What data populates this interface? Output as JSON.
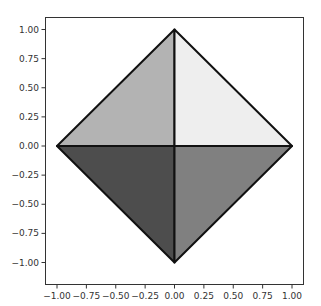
{
  "chart_data": {
    "type": "area",
    "title": "",
    "xlabel": "",
    "ylabel": "",
    "xlim": [
      -1.1,
      1.1
    ],
    "ylim": [
      -1.1,
      1.1
    ],
    "grid": false,
    "legend": null,
    "x_ticks": [
      "-1.00",
      "-0.75",
      "-0.50",
      "-0.25",
      "0.00",
      "0.25",
      "0.50",
      "0.75",
      "1.00"
    ],
    "y_ticks": [
      "1.00",
      "0.75",
      "0.50",
      "0.25",
      "0.00",
      "-0.25",
      "-0.50",
      "-0.75",
      "-1.00"
    ],
    "polygons": [
      {
        "name": "upper-left triangle",
        "vertices": [
          [
            -1,
            0
          ],
          [
            0,
            1
          ],
          [
            0,
            0
          ]
        ],
        "fill": "#b3b3b3"
      },
      {
        "name": "upper-right triangle",
        "vertices": [
          [
            0,
            0
          ],
          [
            0,
            1
          ],
          [
            1,
            0
          ]
        ],
        "fill": "#eeeeee"
      },
      {
        "name": "lower-left triangle",
        "vertices": [
          [
            -1,
            0
          ],
          [
            0,
            0
          ],
          [
            0,
            -1
          ]
        ],
        "fill": "#4d4d4d"
      },
      {
        "name": "lower-right triangle",
        "vertices": [
          [
            0,
            0
          ],
          [
            1,
            0
          ],
          [
            0,
            -1
          ]
        ],
        "fill": "#808080"
      }
    ],
    "edge_color": "#111111"
  }
}
